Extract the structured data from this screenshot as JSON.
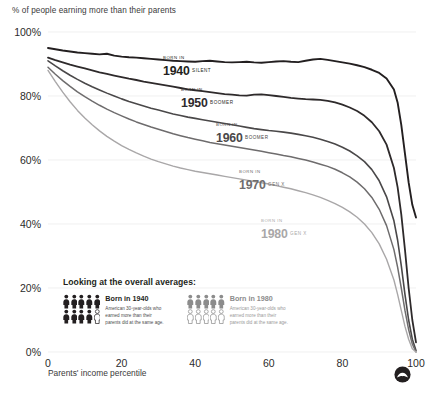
{
  "chart_data": {
    "type": "line",
    "title": "% of people earning more than their parents",
    "xlabel": "Parents' income percentile",
    "ylabel": "",
    "xlim": [
      0,
      100
    ],
    "ylim": [
      0,
      100
    ],
    "grid": false,
    "legend_position": "inline-annotations",
    "x_ticks": [
      "0",
      "20",
      "40",
      "60",
      "80",
      "100"
    ],
    "x_tick_values": [
      0,
      20,
      40,
      60,
      80,
      100
    ],
    "y_ticks": [
      "0%",
      "20%",
      "40%",
      "60%",
      "80%",
      "100%"
    ],
    "y_tick_values": [
      0,
      20,
      40,
      60,
      80,
      100
    ],
    "x": [
      0,
      2,
      4,
      6,
      8,
      10,
      12,
      14,
      16,
      18,
      20,
      22,
      24,
      26,
      28,
      30,
      32,
      34,
      36,
      38,
      40,
      42,
      44,
      46,
      48,
      50,
      52,
      54,
      56,
      58,
      60,
      62,
      64,
      66,
      68,
      70,
      72,
      74,
      76,
      78,
      80,
      82,
      84,
      86,
      88,
      90,
      92,
      94,
      95,
      96,
      97,
      98,
      99,
      100
    ],
    "series": [
      {
        "name": "Born in 1940",
        "generation": "SILENT",
        "color": "#231f20",
        "width": 1.9,
        "values": [
          95.0,
          94.6,
          94.2,
          93.9,
          93.6,
          93.4,
          93.2,
          93.0,
          93.2,
          92.6,
          92.3,
          92.1,
          92.0,
          91.8,
          91.6,
          91.4,
          91.2,
          91.0,
          90.9,
          90.8,
          90.7,
          90.9,
          91.0,
          90.8,
          90.6,
          90.5,
          90.6,
          90.7,
          90.5,
          90.4,
          90.6,
          90.8,
          90.9,
          90.7,
          90.6,
          91.0,
          91.4,
          91.6,
          91.3,
          90.9,
          90.5,
          90.1,
          89.6,
          89.0,
          88.2,
          87.2,
          85.5,
          82.0,
          78.0,
          71.0,
          62.0,
          53.0,
          46.0,
          42.0
        ]
      },
      {
        "name": "Born in 1950",
        "generation": "BOOMER",
        "color": "#2e2a2b",
        "width": 1.8,
        "values": [
          92.0,
          91.2,
          90.5,
          89.8,
          89.2,
          88.6,
          88.0,
          87.4,
          86.9,
          86.4,
          85.9,
          85.4,
          85.0,
          84.5,
          84.1,
          83.7,
          83.3,
          82.9,
          82.5,
          82.1,
          81.8,
          81.5,
          81.2,
          80.9,
          80.6,
          80.4,
          80.2,
          80.1,
          80.4,
          80.5,
          80.3,
          80.0,
          79.7,
          79.4,
          79.2,
          79.0,
          78.9,
          78.8,
          78.5,
          78.0,
          77.3,
          76.4,
          75.3,
          73.8,
          71.8,
          69.0,
          64.8,
          57.5,
          51.5,
          43.0,
          32.0,
          20.0,
          10.0,
          3.0
        ]
      },
      {
        "name": "Born in 1960",
        "generation": "BOOMER",
        "color": "#4a4849",
        "width": 1.6,
        "values": [
          91.0,
          89.4,
          87.9,
          86.5,
          85.2,
          84.0,
          82.9,
          81.9,
          80.9,
          80.0,
          79.1,
          78.3,
          77.6,
          76.9,
          76.2,
          75.6,
          75.0,
          74.4,
          73.9,
          73.4,
          73.0,
          72.6,
          72.2,
          71.8,
          71.4,
          71.0,
          70.6,
          70.2,
          69.8,
          69.5,
          69.2,
          69.0,
          68.7,
          68.4,
          68.0,
          67.6,
          67.1,
          66.5,
          65.8,
          65.0,
          64.0,
          62.8,
          61.3,
          59.5,
          57.0,
          53.5,
          48.5,
          41.0,
          35.0,
          27.0,
          18.0,
          10.0,
          4.0,
          0.5
        ]
      },
      {
        "name": "Born in 1970",
        "generation": "GEN X",
        "color": "#6e6c6d",
        "width": 1.5,
        "values": [
          89.0,
          86.8,
          84.8,
          83.0,
          81.3,
          79.8,
          78.4,
          77.1,
          75.9,
          74.8,
          73.8,
          72.8,
          71.9,
          71.1,
          70.3,
          69.6,
          68.9,
          68.2,
          67.6,
          67.0,
          66.5,
          66.0,
          65.5,
          65.1,
          64.7,
          64.3,
          63.9,
          63.5,
          63.1,
          62.7,
          62.3,
          61.9,
          61.4,
          61.0,
          60.5,
          60.0,
          59.4,
          58.7,
          58.0,
          57.1,
          56.0,
          54.7,
          53.1,
          51.0,
          48.3,
          44.6,
          39.5,
          32.0,
          26.5,
          20.0,
          13.0,
          7.0,
          2.5,
          0.0
        ]
      },
      {
        "name": "Born in 1980",
        "generation": "GEN X",
        "color": "#a9a7a8",
        "width": 1.4,
        "values": [
          88.0,
          84.5,
          81.2,
          78.2,
          75.5,
          73.1,
          71.0,
          69.1,
          67.4,
          65.9,
          64.5,
          63.3,
          62.2,
          61.2,
          60.3,
          59.5,
          58.8,
          58.1,
          57.5,
          57.0,
          56.5,
          56.1,
          55.7,
          55.3,
          54.9,
          54.5,
          54.1,
          53.7,
          53.3,
          52.9,
          52.5,
          52.0,
          51.5,
          51.0,
          50.4,
          49.8,
          49.1,
          48.3,
          47.4,
          46.4,
          45.2,
          43.8,
          42.1,
          40.0,
          37.3,
          33.8,
          29.0,
          22.5,
          18.0,
          13.0,
          8.0,
          4.0,
          1.0,
          0.0
        ]
      }
    ]
  },
  "series_labels": [
    {
      "born_in": "BORN IN",
      "year": "1940",
      "generation": "SILENT"
    },
    {
      "born_in": "BORN IN",
      "year": "1950",
      "generation": "BOOMER"
    },
    {
      "born_in": "BORN IN",
      "year": "1960",
      "generation": "BOOMER"
    },
    {
      "born_in": "BORN IN",
      "year": "1970",
      "generation": "GEN X"
    },
    {
      "born_in": "BORN IN",
      "year": "1980",
      "generation": "GEN X"
    }
  ],
  "legend": {
    "heading": "Looking at the overall averages:",
    "groups": [
      {
        "name": "Born in 1940",
        "description": "American 30-year-olds who earned more than their parents did at the same age.",
        "filled": 9,
        "total": 10,
        "color": "#231f20"
      },
      {
        "name": "Born in 1980",
        "description": "American 30-year-olds who earned more than their parents did at the same age.",
        "filled": 5,
        "total": 10,
        "color": "#8c8c8c"
      }
    ]
  },
  "logo": {
    "name": "upshot-logo"
  }
}
